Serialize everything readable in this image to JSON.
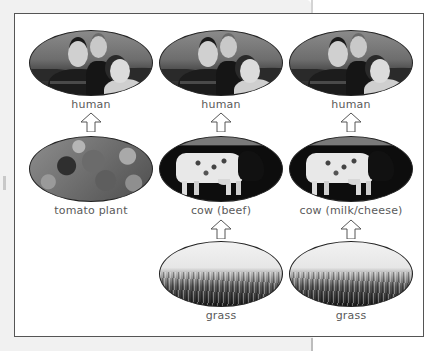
{
  "diagram": {
    "type": "food-chain",
    "columns": [
      {
        "chain": [
          {
            "label": "human",
            "image": "family-photo"
          },
          {
            "label": "tomato plant",
            "image": "tomato-photo"
          }
        ]
      },
      {
        "chain": [
          {
            "label": "human",
            "image": "family-photo"
          },
          {
            "label": "cow (beef)",
            "image": "cow-photo"
          },
          {
            "label": "grass",
            "image": "grass-photo"
          }
        ]
      },
      {
        "chain": [
          {
            "label": "human",
            "image": "family-photo"
          },
          {
            "label": "cow (milk/cheese)",
            "image": "cow-photo"
          },
          {
            "label": "grass",
            "image": "grass-photo"
          }
        ]
      }
    ],
    "arrow_icon": "up-arrow-icon",
    "colors": {
      "frame_border": "#555555",
      "label_text": "#5a5a5a",
      "page_background": "#f1f1f1"
    }
  }
}
